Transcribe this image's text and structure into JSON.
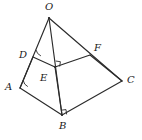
{
  "figure": {
    "background_color": "#ffffff",
    "stroke_color": "#2b2b2b",
    "label_color": "#1a1a1a"
  },
  "vertices": [
    {
      "name": "O",
      "label": "O",
      "x": 49,
      "y": 18,
      "label_x": 45,
      "label_y": 2
    },
    {
      "name": "D",
      "label": "D",
      "x": 33,
      "y": 57,
      "label_x": 19,
      "label_y": 50
    },
    {
      "name": "F",
      "label": "F",
      "x": 90,
      "y": 55,
      "label_x": 94,
      "label_y": 43
    },
    {
      "name": "E",
      "label": "E",
      "x": 55,
      "y": 67,
      "label_x": 40,
      "label_y": 73
    },
    {
      "name": "A",
      "label": "A",
      "x": 20,
      "y": 88,
      "label_x": 5,
      "label_y": 82
    },
    {
      "name": "C",
      "label": "C",
      "x": 122,
      "y": 81,
      "label_x": 127,
      "label_y": 75
    },
    {
      "name": "B",
      "label": "B",
      "x": 62,
      "y": 115,
      "label_x": 59,
      "label_y": 121
    }
  ],
  "edges": [
    {
      "name": "edge-O-A",
      "from": "O",
      "to": "A"
    },
    {
      "name": "edge-O-B",
      "from": "O",
      "to": "B"
    },
    {
      "name": "edge-O-C",
      "from": "O",
      "to": "C"
    },
    {
      "name": "edge-A-B",
      "from": "A",
      "to": "B"
    },
    {
      "name": "edge-B-C",
      "from": "B",
      "to": "C"
    },
    {
      "name": "edge-D-E",
      "from": "D",
      "to": "E"
    },
    {
      "name": "edge-E-F",
      "from": "E",
      "to": "F"
    },
    {
      "name": "edge-F-C",
      "from": "F",
      "to": "C"
    },
    {
      "name": "edge-E-B",
      "from": "E",
      "to": "B"
    }
  ],
  "angle_marks": [
    {
      "name": "angle-arc-at-A",
      "at": "A",
      "kind": "arc"
    },
    {
      "name": "angle-arc-at-D",
      "at": "D",
      "kind": "arc"
    },
    {
      "name": "right-angle-at-E",
      "at": "E",
      "kind": "right-angle"
    },
    {
      "name": "right-angle-at-B",
      "at": "B",
      "kind": "right-angle"
    }
  ]
}
